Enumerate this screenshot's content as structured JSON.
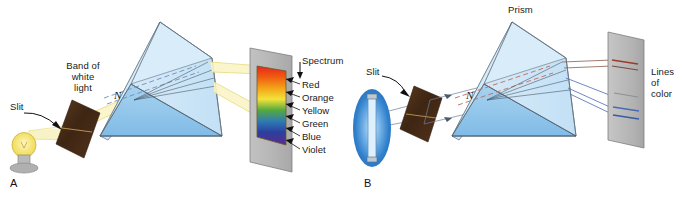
{
  "figure": {
    "background_color": "#ffffff"
  },
  "panels": [
    {
      "id": "A",
      "letter": "A",
      "source_type": "incandescent-bulb",
      "screen_type": "continuous-spectrum",
      "labels": {
        "slit": "Slit",
        "band_line1": "Band of",
        "band_line2": "white",
        "band_line3": "light",
        "normal": "N",
        "spectrum": "Spectrum"
      },
      "spectrum_colors": [
        {
          "name": "Red",
          "hex": "#e8251c"
        },
        {
          "name": "Orange",
          "hex": "#f08a16"
        },
        {
          "name": "Yellow",
          "hex": "#f2e33a"
        },
        {
          "name": "Green",
          "hex": "#2f9c3e"
        },
        {
          "name": "Blue",
          "hex": "#2b44a8"
        },
        {
          "name": "Violet",
          "hex": "#5c2a8c"
        }
      ]
    },
    {
      "id": "B",
      "letter": "B",
      "source_type": "fluorescent-tube",
      "screen_type": "line-spectrum",
      "labels": {
        "slit": "Slit",
        "prism": "Prism",
        "normal": "N",
        "lines_line1": "Lines",
        "lines_line2": "of",
        "lines_line3": "color"
      },
      "line_colors": [
        {
          "name": "red-line",
          "hex": "#9b3b2a"
        },
        {
          "name": "faint-line",
          "hex": "#8a8f96"
        },
        {
          "name": "blue-line-1",
          "hex": "#3a5aa8"
        },
        {
          "name": "blue-line-2",
          "hex": "#4a6ab8"
        }
      ]
    }
  ],
  "colors": {
    "prism_light": "#cfe6f7",
    "prism_mid": "#a9d2ef",
    "prism_front": "#7ab7e5",
    "prism_edge": "#4a5a6a",
    "screen_gray": "#b7b7b7",
    "screen_gray_dark": "#9a9a9a",
    "slit_plate": "#4a2e18",
    "beam_yellow": "#f5efb8",
    "beam_ray": "#6a7f9c",
    "bulb_glow": "#f7e98a",
    "bulb_base": "#a8a8a8",
    "tube_glow": "#3f8fd6",
    "normal_dash": "#6d7d8f",
    "normal_dash_red": "#c06a5a"
  }
}
